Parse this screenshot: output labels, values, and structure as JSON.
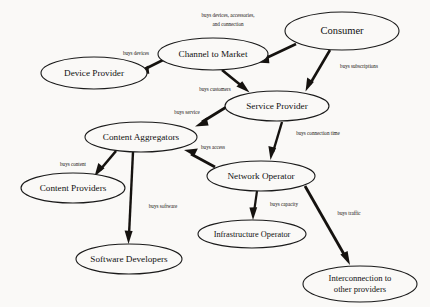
{
  "diagram": {
    "background_color": "#faf9f7",
    "line_color": "#15120f",
    "node_fill": "#faf9f7",
    "nodes": [
      {
        "id": "consumer",
        "label": "Consumer",
        "cx": 342,
        "cy": 31,
        "rx": 57,
        "ry": 19,
        "font_size": 10.5
      },
      {
        "id": "channel_to_market",
        "label": "Channel to Market",
        "cx": 213,
        "cy": 54,
        "rx": 55,
        "ry": 16,
        "font_size": 9.2
      },
      {
        "id": "device_provider",
        "label": "Device Provider",
        "cx": 94,
        "cy": 73,
        "rx": 53,
        "ry": 16,
        "font_size": 9.2
      },
      {
        "id": "service_provider",
        "label": "Service Provider",
        "cx": 277,
        "cy": 106,
        "rx": 52,
        "ry": 15,
        "font_size": 9.2
      },
      {
        "id": "content_aggregators",
        "label": "Content Aggregators",
        "cx": 141,
        "cy": 137,
        "rx": 56,
        "ry": 15,
        "font_size": 9.2
      },
      {
        "id": "network_operator",
        "label": "Network Operator",
        "cx": 261,
        "cy": 176,
        "rx": 54,
        "ry": 15,
        "font_size": 9.2
      },
      {
        "id": "content_providers",
        "label": "Content Providers",
        "cx": 73,
        "cy": 188,
        "rx": 52,
        "ry": 15,
        "font_size": 9.2
      },
      {
        "id": "infrastructure_operator",
        "label": "Infrastructure Operator",
        "cx": 252,
        "cy": 234,
        "rx": 54,
        "ry": 14,
        "font_size": 8.3
      },
      {
        "id": "software_developers",
        "label": "Software Developers",
        "cx": 129,
        "cy": 259,
        "rx": 53,
        "ry": 15,
        "font_size": 9.2
      },
      {
        "id": "interconnection",
        "label_line1": "Interconnection to",
        "label_line2": "other providers",
        "cx": 360,
        "cy": 284,
        "rx": 57,
        "ry": 18,
        "font_size": 8.6
      }
    ],
    "edges": [
      {
        "id": "consumer-to-channel",
        "from": "consumer",
        "to": "channel_to_market",
        "label": "buys devices, accessories,",
        "label_line2": "and connection",
        "label_x": 228,
        "label_y": 16,
        "label_y2": 25
      },
      {
        "id": "channel-to-device-provider",
        "from": "channel_to_market",
        "to": "device_provider",
        "label": "buys devices",
        "label_x": 136,
        "label_y": 54
      },
      {
        "id": "consumer-to-service-provider",
        "from": "consumer",
        "to": "service_provider",
        "label": "buys subscriptions",
        "label_x": 359,
        "label_y": 67
      },
      {
        "id": "channel-to-service-provider",
        "from": "channel_to_market",
        "to": "service_provider",
        "label": "buys customers",
        "label_x": 215,
        "label_y": 90
      },
      {
        "id": "service-provider-to-content-aggregators",
        "from": "service_provider",
        "to": "content_aggregators",
        "label": "buys service",
        "label_x": 187,
        "label_y": 113
      },
      {
        "id": "service-provider-to-network-operator",
        "from": "service_provider",
        "to": "network_operator",
        "label": "buys connection time",
        "label_x": 318,
        "label_y": 134
      },
      {
        "id": "network-operator-to-content-aggregators",
        "from": "network_operator",
        "to": "content_aggregators",
        "label": "buys access",
        "label_x": 213,
        "label_y": 148
      },
      {
        "id": "content-aggregators-to-content-providers",
        "from": "content_aggregators",
        "to": "content_providers",
        "label": "buys content",
        "label_x": 73,
        "label_y": 165
      },
      {
        "id": "content-aggregators-to-software-developers",
        "from": "content_aggregators",
        "to": "software_developers",
        "label": "buys software",
        "label_x": 163,
        "label_y": 207
      },
      {
        "id": "network-operator-to-infrastructure-operator",
        "from": "network_operator",
        "to": "infrastructure_operator",
        "label": "buys capacity",
        "label_x": 284,
        "label_y": 205
      },
      {
        "id": "network-operator-to-interconnection",
        "from": "network_operator",
        "to": "interconnection",
        "label": "buys traffic",
        "label_x": 349,
        "label_y": 214
      }
    ]
  }
}
